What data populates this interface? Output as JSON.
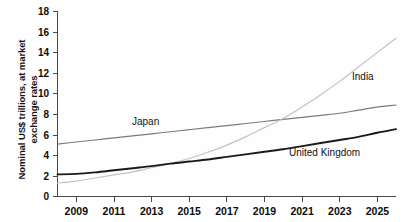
{
  "figure": {
    "clipped_header_text": "",
    "ylabel_line1": "Nominal US$ trillions, at market",
    "ylabel_line2": "exchange rates"
  },
  "axes": {
    "y_ticks": [
      "18",
      "16",
      "14",
      "12",
      "10",
      "8",
      "6",
      "4",
      "2",
      "0"
    ],
    "x_ticks": [
      "2009",
      "2011",
      "2013",
      "2015",
      "2017",
      "2019",
      "2021",
      "2023",
      "2025"
    ]
  },
  "series_labels": {
    "japan": "Japan",
    "india": "India",
    "united_kingdom": "United Kingdom"
  },
  "colors": {
    "japan": "#7a7a7a",
    "india": "#c2c2c2",
    "united_kingdom": "#1a1a1a",
    "axis": "#4a4a4a",
    "text": "#0d0d0d",
    "background": "#fefefe"
  },
  "chart_data": {
    "type": "line",
    "title": "",
    "xlabel": "",
    "ylabel": "Nominal US$ trillions, at market exchange rates",
    "xlim": [
      2008,
      2026
    ],
    "ylim": [
      0,
      18
    ],
    "ytick_step": 2,
    "xtick_step": 2,
    "grid": false,
    "legend": "inline-labels",
    "x": [
      2008,
      2009,
      2010,
      2011,
      2012,
      2013,
      2014,
      2015,
      2016,
      2017,
      2018,
      2019,
      2020,
      2021,
      2022,
      2023,
      2024,
      2025,
      2026
    ],
    "series": [
      {
        "name": "Japan",
        "color": "#7a7a7a",
        "values": [
          5.1,
          5.3,
          5.5,
          5.7,
          5.9,
          6.1,
          6.3,
          6.5,
          6.7,
          6.9,
          7.1,
          7.3,
          7.5,
          7.7,
          7.9,
          8.1,
          8.4,
          8.7,
          8.9
        ]
      },
      {
        "name": "India",
        "color": "#c2c2c2",
        "values": [
          1.3,
          1.5,
          1.8,
          2.1,
          2.4,
          2.8,
          3.2,
          3.7,
          4.3,
          5.0,
          5.8,
          6.7,
          7.6,
          8.7,
          9.9,
          11.2,
          12.6,
          14.0,
          15.4
        ]
      },
      {
        "name": "United Kingdom",
        "color": "#1a1a1a",
        "values": [
          2.15,
          2.2,
          2.35,
          2.55,
          2.75,
          2.95,
          3.2,
          3.4,
          3.6,
          3.85,
          4.1,
          4.35,
          4.6,
          4.9,
          5.2,
          5.5,
          5.8,
          6.2,
          6.55
        ]
      }
    ],
    "annotations": [
      {
        "text": "Japan",
        "x": 2013.0,
        "y": 7.0
      },
      {
        "text": "India",
        "x": 2024.0,
        "y": 11.8
      },
      {
        "text": "United Kingdom",
        "x": 2023.0,
        "y": 4.6
      }
    ]
  }
}
